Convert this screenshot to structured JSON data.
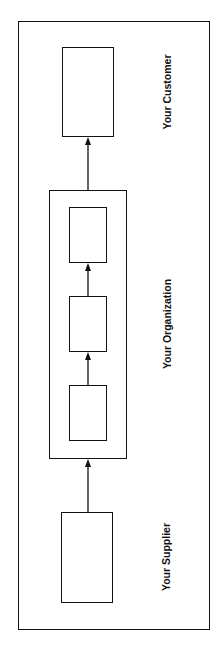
{
  "diagram": {
    "type": "process-flow",
    "orientation": "vertical-rotated",
    "labels": {
      "customer": "Your Customer",
      "organization": "Your Organization",
      "supplier": "Your Supplier"
    },
    "nodes": [
      {
        "id": "customer-box",
        "label": ""
      },
      {
        "id": "org-step-1",
        "label": ""
      },
      {
        "id": "org-step-2",
        "label": ""
      },
      {
        "id": "org-step-3",
        "label": ""
      },
      {
        "id": "supplier-box",
        "label": ""
      }
    ],
    "edges": [
      {
        "from": "supplier-box",
        "to": "organization-container"
      },
      {
        "from": "org-step-3",
        "to": "org-step-2"
      },
      {
        "from": "org-step-2",
        "to": "org-step-1"
      },
      {
        "from": "organization-container",
        "to": "customer-box"
      }
    ],
    "colors": {
      "stroke": "#111111",
      "background": "#ffffff"
    }
  }
}
